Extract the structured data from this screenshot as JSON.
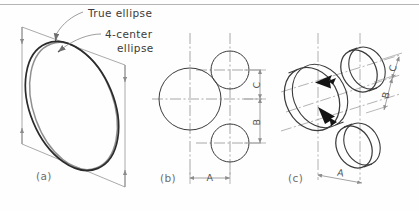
{
  "figure": {
    "title_rule": "top-horizontal-rule",
    "background_color": "#fefefe",
    "ink_color": "#3b3b3b",
    "construction_color": "#9a9a9a",
    "centerline_color": "#8c8c8c",
    "arrow_color": "#1a1a1a"
  },
  "annotations": {
    "true_ellipse": "True ellipse",
    "four_center_line1": "4-center",
    "four_center_line2": "ellipse"
  },
  "panels": {
    "a": {
      "caption": "(a)",
      "description": "rhombus with true ellipse and 4-center ellipse"
    },
    "b": {
      "caption": "(b)",
      "description": "orthographic view with one large and two small circles"
    },
    "c": {
      "caption": "(c)",
      "description": "isometric pictorial with elliptical cylinders and arrows"
    }
  },
  "dimensions": {
    "b": {
      "a": "A",
      "b": "B",
      "c": "C"
    },
    "c": {
      "a": "A",
      "b": "B",
      "c": "C"
    }
  }
}
